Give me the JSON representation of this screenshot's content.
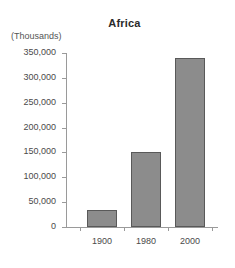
{
  "chart_data": {
    "type": "bar",
    "title": "Africa",
    "unit_label": "(Thousands)",
    "xlabel": "",
    "ylabel": "",
    "categories": [
      "1900",
      "1980",
      "2000"
    ],
    "values": [
      35000,
      150000,
      340000
    ],
    "series": [
      {
        "name": "Africa",
        "values": [
          35000,
          150000,
          340000
        ]
      }
    ],
    "ylim": [
      0,
      350000
    ],
    "ytick_values": [
      0,
      50000,
      100000,
      150000,
      200000,
      250000,
      300000,
      350000
    ],
    "ytick_labels": [
      "0",
      "50,000",
      "100,000",
      "150,000",
      "200,000",
      "250,000",
      "300,000",
      "350,000"
    ],
    "grid": false,
    "legend": "none",
    "bar_color": "#8c8c8c",
    "bar_edge_color": "#595959",
    "background_color": "#ffffff",
    "axis_color": "#9a9a9a"
  }
}
